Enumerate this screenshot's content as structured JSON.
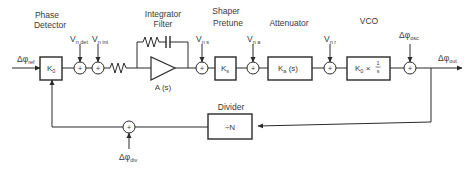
{
  "diagram": {
    "input": {
      "symbol": "Δφ",
      "subscript": "ref"
    },
    "output": {
      "symbol": "Δφ",
      "subscript": "out"
    },
    "stages": {
      "phase_detector": {
        "label_line1": "Phase",
        "label_line2": "Detector",
        "block": "K",
        "block_sub": "0"
      },
      "integrator_filter": {
        "label_line1": "Integrator",
        "label_line2": "Filter",
        "block": "A (s)"
      },
      "shaper_pretune": {
        "label_line1": "Shaper",
        "label_line2": "Pretune",
        "block": "K",
        "block_sub": "s"
      },
      "attenuator": {
        "label": "Attenuator",
        "block": "K",
        "block_sub": "a",
        "block_suffix": " (s)"
      },
      "vco": {
        "label": "VCO",
        "block": "K",
        "block_sub": "0",
        "block_suffix": " × ",
        "frac_num": "1",
        "frac_den": "s"
      },
      "divider": {
        "label": "Divider",
        "block": "÷N"
      }
    },
    "noise_sources": {
      "vn_det": {
        "symbol": "V",
        "subscript": "n det"
      },
      "vn_int": {
        "symbol": "V",
        "subscript": "n int"
      },
      "vn_s": {
        "symbol": "V",
        "subscript": "n s"
      },
      "vn_a": {
        "symbol": "V",
        "subscript": "n a"
      },
      "vn_r": {
        "symbol": "V",
        "subscript": "n r"
      },
      "phi_osc": {
        "symbol": "Δφ",
        "subscript": "osc"
      },
      "phi_div": {
        "symbol": "Δφ",
        "subscript": "div"
      }
    },
    "summer_sign": "+",
    "colors": {
      "line": "#2a2a2a",
      "text": "#3a3a3a",
      "background": "#ffffff"
    }
  }
}
